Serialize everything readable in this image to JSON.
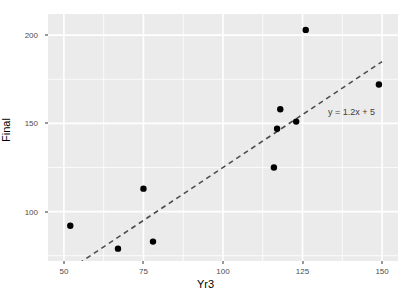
{
  "chart": {
    "xlabel": "Yr3",
    "ylabel": "Final",
    "annotation": "y = 1.2x + 5"
  },
  "chart_data": {
    "type": "scatter",
    "title": "",
    "xlabel": "Yr3",
    "ylabel": "Final",
    "xlim": [
      45,
      155
    ],
    "ylim": [
      72,
      212
    ],
    "xticks": [
      50,
      75,
      100,
      125,
      150
    ],
    "yticks": [
      100,
      150,
      200
    ],
    "xtick_labels": [
      "50",
      "75",
      "100",
      "125",
      "150"
    ],
    "ytick_labels": [
      "100",
      "150",
      "200"
    ],
    "grid": true,
    "grid_color": "#ffffff",
    "panel_color": "#ebebeb",
    "point_color": "#000000",
    "legend": "none",
    "series": [
      {
        "name": "observations",
        "marker": "filled-circle",
        "points": [
          {
            "x": 52,
            "y": 92
          },
          {
            "x": 67,
            "y": 79
          },
          {
            "x": 75,
            "y": 113
          },
          {
            "x": 78,
            "y": 83
          },
          {
            "x": 116,
            "y": 125
          },
          {
            "x": 117,
            "y": 147
          },
          {
            "x": 118,
            "y": 158
          },
          {
            "x": 123,
            "y": 151
          },
          {
            "x": 126,
            "y": 203
          },
          {
            "x": 149,
            "y": 172
          }
        ]
      }
    ],
    "annotations": [
      {
        "text": "y = 1.2x + 5",
        "x": 133,
        "y": 156
      }
    ],
    "trendline": {
      "type": "line",
      "style": "dashed",
      "color": "#4d4d4d",
      "equation": "y = 1.2x + 5",
      "slope": 1.2,
      "intercept": 5,
      "x_start": 50,
      "x_end": 150,
      "y_start": 65,
      "y_end": 185
    }
  }
}
